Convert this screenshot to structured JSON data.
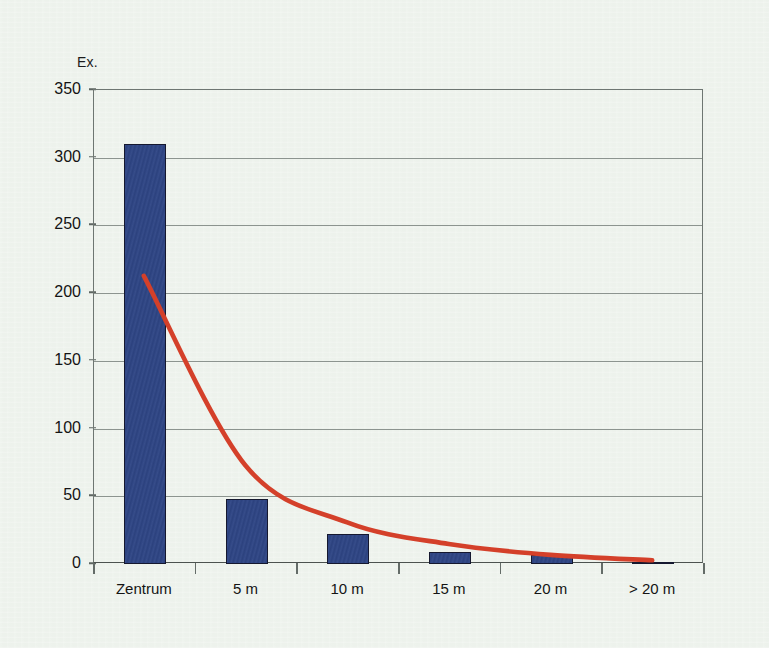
{
  "chart_data": {
    "type": "bar",
    "title": "",
    "subtitle": "",
    "xlabel": "",
    "ylabel": "Ex.",
    "categories": [
      "Zentrum",
      "5 m",
      "10 m",
      "15 m",
      "20 m",
      "> 20 m"
    ],
    "values": [
      310,
      48,
      22,
      9,
      7,
      1
    ],
    "series": [
      {
        "name": "Ex.",
        "type": "bar",
        "values": [
          310,
          48,
          22,
          9,
          7,
          1
        ],
        "color": "#2e4585"
      },
      {
        "name": "Trendline",
        "type": "line",
        "values": [
          212,
          72,
          30,
          14,
          6,
          2
        ],
        "color": "#d4402a"
      }
    ],
    "ylim": [
      0,
      350
    ],
    "yticks": [
      0,
      50,
      100,
      150,
      200,
      250,
      300,
      350
    ],
    "ytick_labels": [
      "0",
      "50",
      "100",
      "150",
      "200",
      "250",
      "300",
      "350"
    ],
    "grid": true,
    "grid_axis": "y",
    "legend": false,
    "legend_position": "none",
    "annotations": []
  },
  "axes": {
    "y_title": "Ex."
  },
  "colors": {
    "background": "#edf2ec",
    "bar_fill": "#2e4585",
    "bar_stroke": "#15182f",
    "trend_line": "#d4402a",
    "gridline": "#8c948f",
    "frame": "#6e7672",
    "text": "#141414"
  }
}
